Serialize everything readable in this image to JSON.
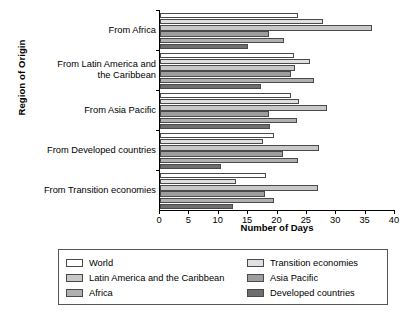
{
  "chart_data": {
    "type": "bar",
    "orientation": "horizontal",
    "title": "",
    "xlabel": "Number of Days",
    "ylabel": "Region of Origin",
    "xlim": [
      0,
      40
    ],
    "xticks": [
      0,
      5,
      10,
      15,
      20,
      25,
      30,
      35,
      40
    ],
    "grid": false,
    "legend_position": "bottom",
    "categories": [
      "From Africa",
      "From Latin America and\nthe Caribbean",
      "From Asia Pacific",
      "From Developed countries",
      "From Transition economies"
    ],
    "series": [
      {
        "name": "World",
        "color": "#ffffff",
        "values": [
          23.5,
          22.8,
          22.3,
          19.4,
          18.0
        ]
      },
      {
        "name": "Transition economies",
        "color": "#e0e0e0",
        "values": [
          27.7,
          25.5,
          23.6,
          17.5,
          12.9
        ]
      },
      {
        "name": "Latin America and the Caribbean",
        "color": "#c8c8c8",
        "values": [
          36.1,
          23.0,
          28.4,
          27.1,
          26.9
        ]
      },
      {
        "name": "Asia Pacific",
        "color": "#9e9e9e",
        "values": [
          18.6,
          22.3,
          18.6,
          20.9,
          17.8
        ]
      },
      {
        "name": "Africa",
        "color": "#b0b0b0",
        "values": [
          21.1,
          26.2,
          23.4,
          23.5,
          19.4
        ]
      },
      {
        "name": "Developed countries",
        "color": "#6e6e6e",
        "values": [
          14.9,
          17.2,
          18.7,
          10.4,
          12.4
        ]
      }
    ],
    "legend": [
      {
        "label": "World",
        "color": "#ffffff"
      },
      {
        "label": "Latin America and the Caribbean",
        "color": "#c8c8c8"
      },
      {
        "label": "Africa",
        "color": "#b0b0b0"
      },
      {
        "label": "Transition economies",
        "color": "#e0e0e0"
      },
      {
        "label": "Asia Pacific",
        "color": "#9e9e9e"
      },
      {
        "label": "Developed countries",
        "color": "#6e6e6e"
      }
    ]
  }
}
